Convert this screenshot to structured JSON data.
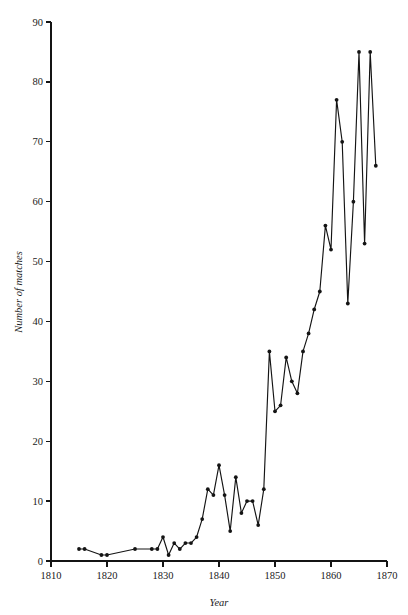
{
  "chart_data": {
    "type": "line",
    "title": "",
    "xlabel": "Year",
    "ylabel": "Number of matches",
    "xlim": [
      1810,
      1870
    ],
    "ylim": [
      0,
      90
    ],
    "grid": false,
    "legend": false,
    "xticks": [
      1810,
      1820,
      1830,
      1840,
      1850,
      1860,
      1870
    ],
    "xtick_labels": [
      "1810",
      "1820",
      "1830",
      "1840",
      "1850",
      "1860",
      "1870"
    ],
    "yticks": [
      0,
      10,
      20,
      30,
      40,
      50,
      60,
      70,
      80,
      90
    ],
    "ytick_labels": [
      "0",
      "10",
      "20",
      "30",
      "40",
      "50",
      "60",
      "70",
      "80",
      "90"
    ],
    "marker": "filled-circle",
    "line_color": "#141414",
    "marker_color": "#141414",
    "x": [
      1815,
      1816,
      1819,
      1820,
      1825,
      1828,
      1829,
      1830,
      1831,
      1832,
      1833,
      1834,
      1835,
      1836,
      1837,
      1838,
      1839,
      1840,
      1841,
      1842,
      1843,
      1844,
      1845,
      1846,
      1847,
      1848,
      1849,
      1850,
      1851,
      1852,
      1853,
      1854,
      1855,
      1856,
      1857,
      1858,
      1859,
      1860,
      1861,
      1862,
      1863,
      1864,
      1865,
      1866,
      1867,
      1868
    ],
    "y": [
      2,
      2,
      1,
      1,
      2,
      2,
      2,
      4,
      1,
      3,
      2,
      3,
      3,
      4,
      7,
      12,
      11,
      16,
      11,
      5,
      14,
      8,
      10,
      10,
      6,
      12,
      35,
      25,
      26,
      34,
      30,
      28,
      35,
      38,
      42,
      45,
      56,
      52,
      77,
      70,
      43,
      60,
      85,
      53,
      85,
      66
    ],
    "series": [
      {
        "name": "Number of matches",
        "values": [
          2,
          2,
          1,
          1,
          2,
          2,
          2,
          4,
          1,
          3,
          2,
          3,
          3,
          4,
          7,
          12,
          11,
          16,
          11,
          5,
          14,
          8,
          10,
          10,
          6,
          12,
          35,
          25,
          26,
          34,
          30,
          28,
          35,
          38,
          42,
          45,
          56,
          52,
          77,
          70,
          43,
          60,
          85,
          53,
          85,
          66
        ]
      }
    ]
  },
  "axes": {
    "y_title": "Number of matches",
    "x_title": "Year"
  }
}
